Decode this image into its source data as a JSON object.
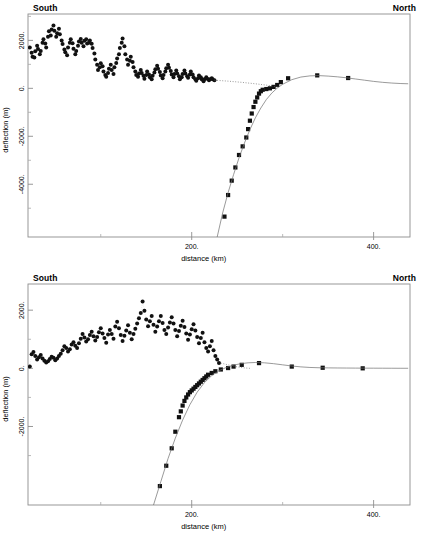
{
  "figure": {
    "orientation_left": "South",
    "orientation_right": "North",
    "background": "#ffffff",
    "line_color": "#6e6e6e",
    "marker_color": "#111111"
  },
  "chart_data": [
    {
      "id": "top",
      "type": "scatter",
      "title": "",
      "subtitle": "",
      "xlabel": "distance (km)",
      "ylabel": "deflection (m)",
      "xlim": [
        20,
        440
      ],
      "ylim": [
        -6200,
        3100
      ],
      "grid": false,
      "legend": "none",
      "xticks": [
        200,
        400
      ],
      "xticklabels": [
        "200.",
        "400."
      ],
      "xticks_minor": [
        100,
        300
      ],
      "yticks": [
        2000,
        0,
        -2000,
        -4000
      ],
      "yticklabels": [
        "2000.",
        "0.",
        "-2000.",
        "-4000."
      ],
      "yticks_minor": [
        3000,
        1000,
        -1000,
        -3000,
        -5000
      ],
      "annotations": [
        {
          "text": "South",
          "position": "top-left"
        },
        {
          "text": "North",
          "position": "top-right"
        }
      ],
      "series": [
        {
          "name": "observed deflection (circles)",
          "marker": "circle",
          "x": [
            22,
            24,
            25,
            27,
            28,
            30,
            31,
            33,
            34,
            36,
            37,
            39,
            40,
            42,
            43,
            45,
            46,
            48,
            49,
            51,
            52,
            54,
            55,
            57,
            58,
            60,
            61,
            63,
            64,
            66,
            67,
            69,
            70,
            72,
            73,
            75,
            76,
            78,
            79,
            81,
            82,
            84,
            85,
            87,
            88,
            90,
            91,
            93,
            94,
            96,
            97,
            99,
            100,
            102,
            103,
            105,
            106,
            108,
            109,
            111,
            112,
            114,
            115,
            117,
            118,
            120,
            121,
            123,
            124,
            126,
            127,
            129,
            130,
            132,
            133,
            135,
            136,
            138,
            139,
            141,
            142,
            144,
            145,
            147,
            148,
            150,
            151,
            153,
            154,
            156,
            157,
            159,
            160,
            162,
            163,
            165,
            166,
            168,
            169,
            171,
            172,
            174,
            175,
            177,
            178,
            180,
            181,
            183,
            184,
            186,
            187,
            189,
            190,
            192,
            193,
            195,
            196,
            198,
            199,
            201,
            202,
            204,
            205,
            207,
            208,
            210,
            211,
            213,
            214,
            216,
            217,
            219,
            220,
            222,
            223,
            225
          ],
          "y": [
            1700,
            1480,
            1320,
            1290,
            1550,
            1780,
            1640,
            1420,
            1560,
            1900,
            2050,
            1870,
            1700,
            2150,
            2380,
            2200,
            2450,
            2620,
            2400,
            2150,
            2300,
            2480,
            2260,
            2000,
            1850,
            1620,
            1500,
            1380,
            1700,
            1900,
            2050,
            1880,
            1650,
            1420,
            1560,
            1780,
            1950,
            2060,
            1900,
            1750,
            1980,
            2050,
            1870,
            1900,
            2000,
            1860,
            1680,
            1450,
            1200,
            980,
            760,
            880,
            1050,
            920,
            700,
            560,
            480,
            640,
            820,
            980,
            760,
            600,
            880,
            1060,
            1240,
            1420,
            1680,
            1900,
            2080,
            1750,
            1420,
            1200,
            980,
            1150,
            1320,
            1100,
            880,
            700,
            560,
            480,
            620,
            760,
            640,
            520,
            400,
            560,
            700,
            580,
            460,
            380,
            520,
            660,
            800,
            940,
            820,
            680,
            540,
            420,
            560,
            700,
            840,
            980,
            860,
            720,
            580,
            460,
            600,
            740,
            620,
            500,
            380,
            460,
            600,
            740,
            620,
            500,
            440,
            580,
            700,
            580,
            460,
            380,
            320,
            420,
            540,
            460,
            380,
            300,
            380,
            460,
            400,
            340,
            380,
            420,
            380,
            340
          ]
        },
        {
          "name": "modelled deflection (squares)",
          "marker": "square",
          "x": [
            236,
            240,
            244,
            248,
            252,
            256,
            260,
            262,
            264,
            266,
            268,
            270,
            272,
            274,
            276,
            278,
            282,
            286,
            290,
            294,
            298,
            306,
            338,
            372
          ],
          "y": [
            -5350,
            -4450,
            -3850,
            -3300,
            -2780,
            -2420,
            -2050,
            -1700,
            -1350,
            -1050,
            -780,
            -560,
            -380,
            -220,
            -120,
            -60,
            -30,
            0,
            60,
            140,
            260,
            420,
            540,
            430,
            300
          ]
        },
        {
          "name": "flexural fit curve",
          "marker": "none",
          "style": "solid-thin",
          "x": [
            228,
            234,
            240,
            246,
            252,
            258,
            264,
            270,
            276,
            282,
            288,
            294,
            300,
            310,
            320,
            330,
            340,
            350,
            360,
            370,
            380,
            390,
            400,
            410,
            420,
            430,
            438
          ],
          "y": [
            -6200,
            -5200,
            -4350,
            -3600,
            -2900,
            -2280,
            -1720,
            -1230,
            -820,
            -470,
            -200,
            10,
            170,
            360,
            470,
            520,
            530,
            510,
            480,
            440,
            390,
            340,
            290,
            250,
            220,
            200,
            190
          ]
        },
        {
          "name": "dotted connector",
          "marker": "none",
          "style": "dotted-thin",
          "x": [
            225,
            240,
            255,
            270,
            285,
            295
          ],
          "y": [
            340,
            300,
            250,
            190,
            120,
            60
          ]
        }
      ]
    },
    {
      "id": "bottom",
      "type": "scatter",
      "title": "",
      "subtitle": "",
      "xlabel": "distance (km)",
      "ylabel": "deflection (m)",
      "xlim": [
        20,
        440
      ],
      "ylim": [
        -4700,
        2900
      ],
      "grid": false,
      "legend": "none",
      "xticks": [
        200,
        400
      ],
      "xticklabels": [
        "200.",
        "400."
      ],
      "xticks_minor": [
        100,
        300
      ],
      "yticks": [
        2000,
        0,
        -2000
      ],
      "yticklabels": [
        "2000.",
        "0.",
        "-2000."
      ],
      "yticks_minor": [
        1000,
        -1000,
        -3000
      ],
      "annotations": [
        {
          "text": "South",
          "position": "top-left"
        },
        {
          "text": "North",
          "position": "top-right"
        }
      ],
      "series": [
        {
          "name": "observed deflection (circles)",
          "marker": "circle",
          "x": [
            22,
            24,
            26,
            28,
            30,
            32,
            34,
            36,
            38,
            40,
            42,
            44,
            46,
            48,
            50,
            52,
            54,
            56,
            58,
            60,
            62,
            64,
            66,
            68,
            70,
            72,
            74,
            76,
            78,
            80,
            82,
            84,
            86,
            88,
            90,
            92,
            94,
            96,
            98,
            100,
            102,
            104,
            106,
            108,
            110,
            112,
            114,
            116,
            118,
            120,
            122,
            124,
            126,
            128,
            130,
            132,
            134,
            136,
            138,
            140,
            142,
            144,
            146,
            148,
            150,
            152,
            154,
            156,
            158,
            160,
            162,
            164,
            166,
            168,
            170,
            172,
            174,
            176,
            178,
            180,
            182,
            184,
            186,
            188,
            190,
            192,
            194,
            196,
            198,
            200,
            202,
            204,
            206,
            208,
            210,
            212,
            214,
            216,
            218,
            220,
            222,
            224,
            226,
            228,
            230,
            232
          ],
          "y": [
            60,
            480,
            560,
            420,
            300,
            380,
            460,
            340,
            260,
            200,
            240,
            320,
            400,
            360,
            280,
            340,
            420,
            500,
            620,
            760,
            700,
            580,
            660,
            820,
            900,
            780,
            700,
            860,
            1020,
            1180,
            1060,
            920,
            1000,
            1150,
            1260,
            1100,
            960,
            1080,
            1240,
            1380,
            1200,
            1040,
            880,
            1160,
            1320,
            1180,
            1020,
            1440,
            1600,
            1380,
            1150,
            940,
            1120,
            1300,
            1480,
            1220,
            1000,
            1180,
            1360,
            1540,
            1720,
            1900,
            2300,
            1980,
            1680,
            1450,
            1620,
            1800,
            1500,
            1260,
            1440,
            1620,
            1800,
            1560,
            1320,
            1180,
            1400,
            1580,
            1760,
            1540,
            1320,
            1100,
            1280,
            1460,
            1640,
            1420,
            1200,
            980,
            1160,
            1340,
            1520,
            1300,
            1080,
            860,
            1040,
            1220,
            900,
            700,
            580,
            760,
            940,
            620,
            420,
            300,
            180
          ]
        },
        {
          "name": "modelled deflection (squares)",
          "marker": "square",
          "x": [
            165,
            172,
            178,
            182,
            186,
            188,
            190,
            192,
            194,
            196,
            198,
            200,
            202,
            204,
            206,
            208,
            210,
            212,
            214,
            216,
            218,
            222,
            226,
            232,
            240,
            246,
            255,
            274,
            310,
            344,
            388
          ],
          "y": [
            -4050,
            -3350,
            -2750,
            -2180,
            -1680,
            -1480,
            -1280,
            -1120,
            -1000,
            -900,
            -820,
            -760,
            -700,
            -640,
            -580,
            -520,
            -460,
            -400,
            -340,
            -280,
            -220,
            -160,
            -100,
            -40,
            10,
            60,
            120,
            180,
            60,
            20,
            0
          ]
        },
        {
          "name": "flexural fit curve",
          "marker": "none",
          "style": "solid-thin",
          "x": [
            158,
            166,
            174,
            182,
            190,
            198,
            206,
            214,
            222,
            230,
            238,
            246,
            254,
            262,
            270,
            280,
            290,
            300,
            310,
            320,
            330,
            340,
            350,
            360,
            370,
            380,
            390,
            400,
            410,
            420,
            430,
            438
          ],
          "y": [
            -4700,
            -3900,
            -3100,
            -2400,
            -1780,
            -1250,
            -820,
            -490,
            -250,
            -80,
            30,
            110,
            160,
            190,
            200,
            190,
            160,
            120,
            80,
            50,
            30,
            20,
            15,
            12,
            10,
            8,
            6,
            5,
            4,
            3,
            2,
            2
          ]
        },
        {
          "name": "dotted connector",
          "marker": "none",
          "style": "dotted-thin",
          "x": [
            232,
            240,
            248,
            256,
            264
          ],
          "y": [
            180,
            120,
            60,
            20,
            0
          ]
        }
      ]
    }
  ]
}
